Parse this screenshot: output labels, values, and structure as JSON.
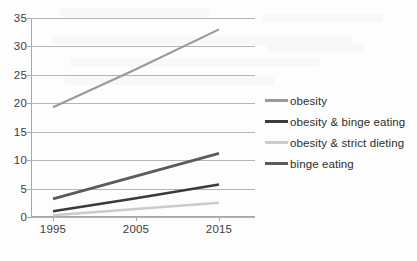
{
  "chart_data": {
    "type": "line",
    "title": "",
    "xlabel": "",
    "ylabel": "",
    "x": [
      1995,
      2005,
      2015
    ],
    "xtick_labels": [
      "1995",
      "2005",
      "2015"
    ],
    "ytick_labels": [
      "0",
      "5",
      "10",
      "15",
      "20",
      "25",
      "30",
      "35"
    ],
    "yticks": [
      0,
      5,
      10,
      15,
      20,
      25,
      30,
      35
    ],
    "ylim": [
      0,
      35
    ],
    "grid": "horizontal",
    "legend_position": "right",
    "series": [
      {
        "name": "obesity",
        "color": "#9a9a9a",
        "width": 2.2,
        "values": [
          19.3,
          26.0,
          33.0
        ]
      },
      {
        "name": "obesity & binge eating",
        "color": "#3a3a3a",
        "width": 2.6,
        "values": [
          1.0,
          3.3,
          5.7
        ]
      },
      {
        "name": "obesity & strict dieting",
        "color": "#cbcbcb",
        "width": 2.4,
        "values": [
          0.3,
          1.4,
          2.5
        ]
      },
      {
        "name": "binge eating",
        "color": "#5b5b5b",
        "width": 2.8,
        "values": [
          3.2,
          7.2,
          11.2
        ]
      }
    ]
  }
}
